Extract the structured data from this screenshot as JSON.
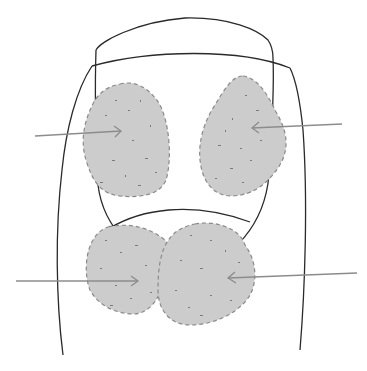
{
  "diagram": {
    "colors": {
      "background": "#ffffff",
      "outline": "#2a2a2a",
      "region_fill": "#cccccc",
      "region_border": "#8a8a8a",
      "stipple": "#7a7a7a",
      "arrow": "#8c8c8c"
    },
    "regions": [
      {
        "id": "upper-left",
        "arrow_from": "left"
      },
      {
        "id": "upper-right",
        "arrow_from": "right"
      },
      {
        "id": "lower-left",
        "arrow_from": "left"
      },
      {
        "id": "lower-right",
        "arrow_from": "right"
      }
    ],
    "arrows": [
      {
        "id": "arrow-upper-left",
        "x1": 35,
        "y1": 136,
        "x2": 121,
        "y2": 131
      },
      {
        "id": "arrow-upper-right",
        "x1": 342,
        "y1": 124,
        "x2": 252,
        "y2": 128
      },
      {
        "id": "arrow-lower-left",
        "x1": 16,
        "y1": 281,
        "x2": 138,
        "y2": 281
      },
      {
        "id": "arrow-lower-right",
        "x1": 357,
        "y1": 273,
        "x2": 228,
        "y2": 278
      }
    ]
  }
}
